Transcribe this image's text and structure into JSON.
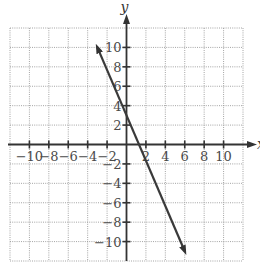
{
  "chart_data": {
    "type": "line",
    "title": "",
    "xlabel": "x",
    "ylabel": "y",
    "xlim": [
      -12,
      12
    ],
    "ylim": [
      -12,
      12
    ],
    "grid": true,
    "grid_step": 2,
    "x_ticks": [
      -10,
      -8,
      -6,
      -4,
      -2,
      2,
      4,
      6,
      8,
      10
    ],
    "y_ticks": [
      10,
      8,
      6,
      4,
      2,
      -2,
      -4,
      -6,
      -8,
      -10
    ],
    "x_tick_labels": [
      "-10",
      "-8",
      "-6",
      "-4",
      "-2",
      "2",
      "4",
      "6",
      "8",
      "10"
    ],
    "y_tick_labels": [
      "10",
      "8",
      "6",
      "4",
      "2",
      "-2",
      "-4",
      "-6",
      "-8",
      "-10"
    ],
    "series": [
      {
        "name": "y = -2x + 4",
        "equation": "y = -2x + 4",
        "slope": -2,
        "y_intercept": 4,
        "x_intercept": 2,
        "x": [
          -3,
          0,
          2,
          6
        ],
        "y": [
          10,
          4,
          0,
          -11
        ],
        "arrows": "both",
        "color": "#3a3a3a"
      }
    ],
    "legend": null
  },
  "colors": {
    "grid": "#9a9a9a",
    "axis": "#333333",
    "line": "#3a3a3a",
    "label": "#4a4a4a",
    "background": "#ffffff"
  }
}
